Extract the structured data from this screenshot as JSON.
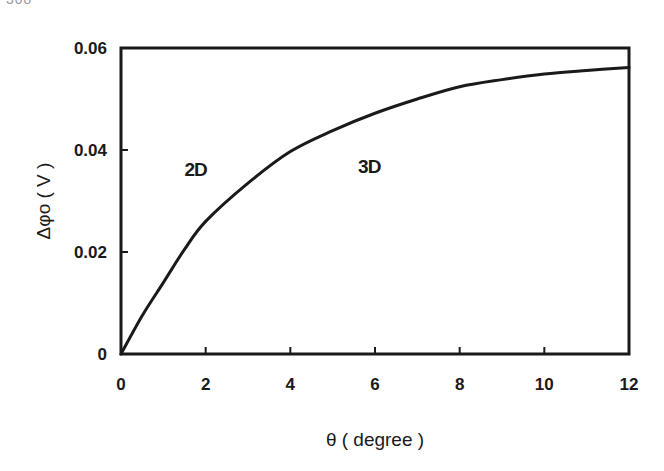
{
  "page_fragment": "308",
  "chart_data": {
    "type": "line",
    "title": "",
    "xlabel": "θ ( degree )",
    "ylabel": "Δφo ( V )",
    "xlim": [
      0,
      12
    ],
    "ylim": [
      0,
      0.06
    ],
    "x_ticks": [
      "0",
      "2",
      "4",
      "6",
      "8",
      "10",
      "12"
    ],
    "y_ticks": [
      "0",
      "0.02",
      "0.04",
      "0.06"
    ],
    "grid": false,
    "legend": null,
    "annotations": [
      {
        "text": "2D",
        "x": 1.5,
        "y": 0.035
      },
      {
        "text": "3D",
        "x": 5.6,
        "y": 0.0355
      }
    ],
    "series": [
      {
        "name": "Δφo",
        "x": [
          0,
          0.5,
          1,
          1.5,
          2,
          3,
          4,
          5,
          6,
          7,
          8,
          9,
          10,
          11,
          12
        ],
        "values": [
          0,
          0.0075,
          0.014,
          0.0205,
          0.026,
          0.0335,
          0.0397,
          0.0438,
          0.0472,
          0.05,
          0.0524,
          0.0538,
          0.0549,
          0.0556,
          0.0562
        ]
      }
    ]
  }
}
